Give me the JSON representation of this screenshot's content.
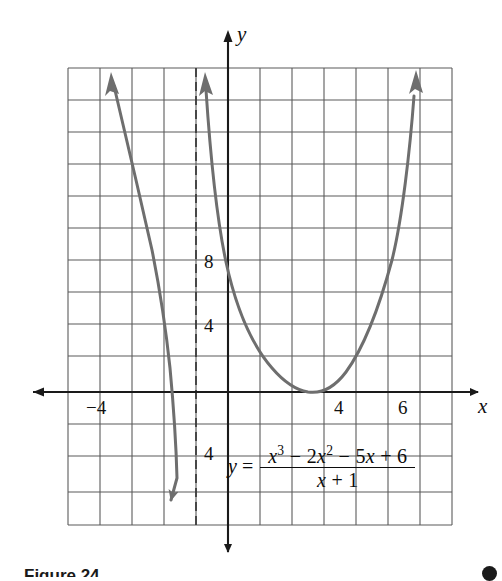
{
  "figure": {
    "caption": "Figure 24",
    "badge": "page-marker-dot"
  },
  "axes": {
    "x_axis_name": "x",
    "y_axis_name": "y",
    "x_tick_labels": [
      {
        "text": "−4",
        "value": -4,
        "px_x": 92,
        "px_y": 398
      },
      {
        "text": "4",
        "value": 4,
        "px_x": 337,
        "px_y": 398
      },
      {
        "text": "6",
        "value": 6,
        "px_x": 401,
        "px_y": 398
      }
    ],
    "y_tick_labels": [
      {
        "text": "8",
        "value": 8,
        "px_x": 203,
        "px_y": 254
      },
      {
        "text": "4",
        "value": 4,
        "px_x": 203,
        "px_y": 318
      },
      {
        "text": "4",
        "value": -4,
        "px_x": 203,
        "px_y": 446
      }
    ],
    "x_axis_label_px": {
      "x": 480,
      "y": 398
    },
    "y_axis_label_px": {
      "x": 236,
      "y": 26
    }
  },
  "equation": {
    "lhs": "y",
    "equals": "=",
    "numerator_parts": [
      {
        "t": "x",
        "italic": true
      },
      {
        "t": "3",
        "sup": true
      },
      {
        "t": " − 2",
        "italic": false
      },
      {
        "t": "x",
        "italic": true
      },
      {
        "t": "2",
        "sup": true
      },
      {
        "t": " − 5",
        "italic": false
      },
      {
        "t": "x",
        "italic": true
      },
      {
        "t": " + 6",
        "italic": false
      }
    ],
    "denominator_parts": [
      {
        "t": "x",
        "italic": true
      },
      {
        "t": " + 1",
        "italic": false
      }
    ],
    "numerator_plain": "x³ − 2x² − 5x + 6",
    "denominator_plain": "x + 1",
    "full_plain": "y = (x³ − 2x² − 5x + 6) / (x + 1)"
  },
  "colors": {
    "grid_line": "#5b5b5b",
    "axis_line": "#1a1a1a",
    "curve": "#6e6e6e",
    "asymptote": "#3d3d3d",
    "background": "#ffffff",
    "text": "#111111"
  },
  "chart_data": {
    "type": "line",
    "title": "",
    "xlabel": "x",
    "ylabel": "y",
    "xlim": [
      -5,
      7
    ],
    "ylim": [
      -6,
      10
    ],
    "grid": true,
    "grid_step": 1,
    "legend": "none",
    "function": "y = (x^3 - 2x^2 - 5x + 6)/(x + 1)",
    "vertical_asymptote": -1,
    "x_ticks_labeled": [
      -4,
      4,
      6
    ],
    "y_ticks_labeled": [
      8,
      4,
      -4
    ],
    "series": [
      {
        "name": "left-branch",
        "comment": "branch for x < -1, rises to +infinity as x -> -5 side, falls to -infinity approaching x = -1",
        "x": [
          -4.55,
          -4.2,
          -3.8,
          -3.4,
          -3.0,
          -2.6,
          -2.2,
          -1.9,
          -1.7,
          -1.55,
          -1.45,
          -1.38
        ],
        "y": [
          10.0,
          8.6,
          6.9,
          5.0,
          3.0,
          0.6,
          -2.6,
          -6.0,
          -9.2,
          -12.5,
          -15.5,
          -18.5
        ]
      },
      {
        "name": "right-branch",
        "comment": "branch for x > -1, descends from +infinity, y-intercept 6, minimum near (3, -1.3), rises through (4, 0) to +infinity",
        "x": [
          -0.62,
          -0.45,
          -0.2,
          0.0,
          0.4,
          0.9,
          1.4,
          1.9,
          2.4,
          2.9,
          3.2,
          3.6,
          4.0,
          4.4,
          4.9,
          5.4,
          5.9,
          6.2
        ],
        "y": [
          10.0,
          7.9,
          6.6,
          6.0,
          4.6,
          3.0,
          1.6,
          0.5,
          -0.6,
          -1.25,
          -1.3,
          -0.9,
          0.0,
          1.2,
          3.1,
          5.3,
          7.8,
          9.6
        ]
      }
    ],
    "annotations": [
      {
        "kind": "arrowhead",
        "series": "left-branch",
        "at": "start",
        "direction": "up"
      },
      {
        "kind": "arrowhead",
        "series": "left-branch",
        "at": "end",
        "direction": "down"
      },
      {
        "kind": "arrowhead",
        "series": "right-branch",
        "at": "start",
        "direction": "up"
      },
      {
        "kind": "arrowhead",
        "series": "right-branch",
        "at": "end",
        "direction": "up"
      },
      {
        "kind": "dashed-vertical-line",
        "x": -1,
        "label": "asymptote"
      }
    ]
  }
}
